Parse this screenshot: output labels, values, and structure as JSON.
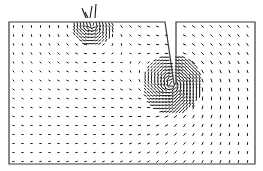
{
  "figure": {
    "kind": "vector-field-plot",
    "width": 263,
    "height": 171,
    "background": "#ffffff",
    "ink_color": "#1a1a1a",
    "boundary_color": "#3a3a3a"
  },
  "domain_geometry": {
    "description": "Rectangular domain with a narrow tapered slot cut down from the top edge",
    "outline": [
      [
        9,
        22
      ],
      [
        165,
        22
      ],
      [
        174,
        84
      ],
      [
        176,
        84
      ],
      [
        176,
        22
      ],
      [
        255,
        22
      ],
      [
        255,
        164
      ],
      [
        9,
        164
      ]
    ],
    "slot": {
      "top_left": [
        165,
        22
      ],
      "top_right": [
        176,
        22
      ],
      "tip": [
        175,
        84
      ]
    }
  },
  "field": {
    "grid_spacing_coarse": 9,
    "grid_spacing_fine": 3.2,
    "singularities": [
      {
        "name": "slot-tip",
        "x": 172,
        "y": 84,
        "strength": 1.0,
        "fine_radius": 30
      },
      {
        "name": "top-source",
        "x": 93,
        "y": 24,
        "strength": 0.7,
        "fine_radius": 22
      }
    ],
    "protruding_arrows": [
      {
        "x1": 86,
        "y1": 18,
        "x2": 82,
        "y2": 8
      },
      {
        "x1": 90,
        "y1": 18,
        "x2": 92,
        "y2": 6
      },
      {
        "x1": 95,
        "y1": 18,
        "x2": 96,
        "y2": 4
      },
      {
        "x1": 88,
        "y1": 18,
        "x2": 85,
        "y2": 12
      }
    ]
  }
}
